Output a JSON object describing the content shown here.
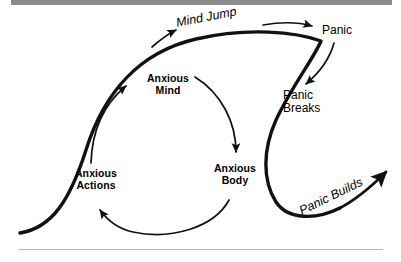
{
  "diagram": {
    "stroke_color": "#111111",
    "background_color": "#ffffff",
    "rule_color": "#8b8b8b",
    "nodes": [
      {
        "id": "anxious-actions",
        "label": "Anxious\nActions",
        "style": "bold"
      },
      {
        "id": "anxious-mind",
        "label": "Anxious\nMind",
        "style": "bold"
      },
      {
        "id": "anxious-body",
        "label": "Anxious\nBody",
        "style": "bold"
      }
    ],
    "flow_labels": [
      {
        "id": "mind-jump",
        "label": "Mind Jump",
        "style": "italic"
      },
      {
        "id": "panic",
        "label": "Panic",
        "style": "regular"
      },
      {
        "id": "panic-breaks",
        "label": "Panic\nBreaks",
        "style": "regular"
      },
      {
        "id": "panic-builds",
        "label": "Panic Builds",
        "style": "italic"
      }
    ]
  }
}
